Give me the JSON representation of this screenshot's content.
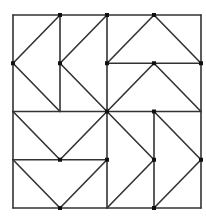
{
  "diagram": {
    "type": "geometric-quilt-pattern",
    "grid": "4x4",
    "frame": {
      "x1": 13,
      "y1": 15,
      "x2": 201,
      "y2": 208
    },
    "center": {
      "x": 107,
      "y": 111.5
    },
    "stroke_color": "#333333",
    "stroke_width": 1.6,
    "quadrants": [
      {
        "name": "top-left",
        "motif": "left-pointing chevrons",
        "count": 2,
        "orientation": "vertical columns"
      },
      {
        "name": "top-right",
        "motif": "upward triangles",
        "count": 2,
        "orientation": "horizontal rows"
      },
      {
        "name": "bottom-left",
        "motif": "downward V shapes",
        "count": 2,
        "orientation": "horizontal rows"
      },
      {
        "name": "bottom-right",
        "motif": "right-pointing chevrons",
        "count": 2,
        "orientation": "vertical columns"
      }
    ]
  }
}
